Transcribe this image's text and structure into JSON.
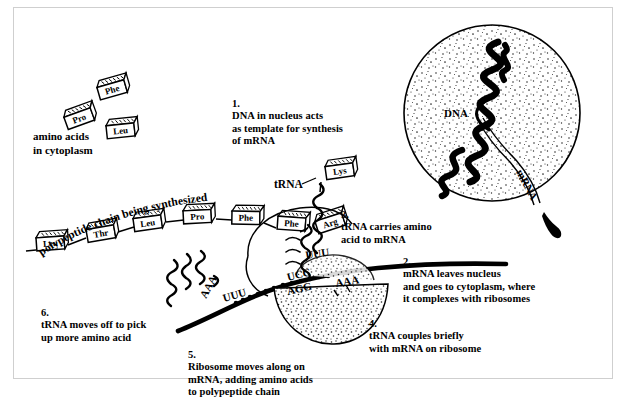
{
  "diagram": {
    "steps": [
      {
        "id": "step1",
        "number": "1.",
        "text": "DNA in nucleus acts\nas template for synthesis\nof mRNA"
      },
      {
        "id": "step2",
        "number": "2.",
        "text": "mRNA leaves nucleus\nand goes to cytoplasm, where\nit complexes with ribosomes"
      },
      {
        "id": "step3",
        "number": "3.",
        "text": "tRNA carries amino\nacid to mRNA"
      },
      {
        "id": "step4",
        "number": "4.",
        "text": "tRNA couples briefly\nwith mRNA on ribosome"
      },
      {
        "id": "step5",
        "number": "5.",
        "text": "Ribosome moves along on\nmRNA, adding amino acids\nto polypeptide chain"
      },
      {
        "id": "step6",
        "number": "6.",
        "text": "tRNA moves off to pick\nup more amino acid"
      }
    ],
    "labels": {
      "amino_acids_pool": "amino acids\nin cytoplasm",
      "polypeptide_chain": "polypeptide chain being synthesized",
      "trna_label": "tRNA",
      "dna_label": "DNA",
      "mrna_label": "mRNA"
    },
    "free_amino_acids": [
      {
        "name": "Phe"
      },
      {
        "name": "Pro"
      },
      {
        "name": "Leu"
      }
    ],
    "polypeptide_residues": [
      {
        "name": "Leu"
      },
      {
        "name": "Thr"
      },
      {
        "name": "Leu"
      },
      {
        "name": "Pro"
      },
      {
        "name": "Phe"
      },
      {
        "name": "Phe"
      }
    ],
    "charged_trna_amino_acid": {
      "name": "Arg"
    },
    "incoming_trna_amino_acid": {
      "name": "Lys"
    },
    "codons": {
      "incoming_trna_anticodon": "UUU",
      "bound_trna_anticodon": "UCC",
      "mrna_codon_bound": "AGG",
      "mrna_codon_next": "AAA",
      "departing_trna_anticodon": "AAA",
      "departing_mrna_codon": "UUU"
    },
    "colors": {
      "ink": "#000000",
      "paper": "#ffffff",
      "frame": "#cfcfcf",
      "stipple": "#3a3a3a"
    }
  }
}
